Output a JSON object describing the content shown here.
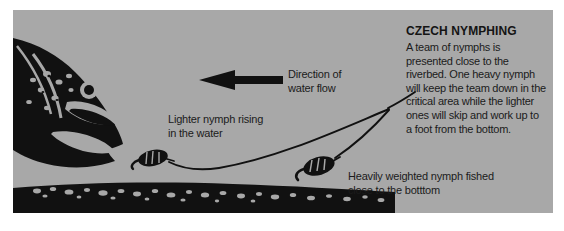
{
  "figure": {
    "type": "illustration",
    "background_color": "#a8a8a8",
    "ink_color": "#111111",
    "text_color": "#1b1b1b"
  },
  "heading": "CZECH NYMPHING",
  "body_copy": "A team of nymphs is presented close to the riverbed. One heavy nymph will keep the team down in the critical area while the lighter ones will skip and work up to a foot from the bottom.",
  "labels": {
    "flow": "Direction of\nwater flow",
    "lighter_nymph": "Lighter nymph rising\nin the water",
    "heavy_nymph": "Heavily weighted nymph fished\nclose to the botttom"
  },
  "elements": {
    "fish": "trout-head-silhouette",
    "arrow": "left-pointing-flow-arrow",
    "riverbed": "pebble-streambed-band",
    "leader": "branching-leader-line",
    "nymph_light": "light-nymph-fly",
    "nymph_heavy": "heavy-nymph-fly"
  }
}
